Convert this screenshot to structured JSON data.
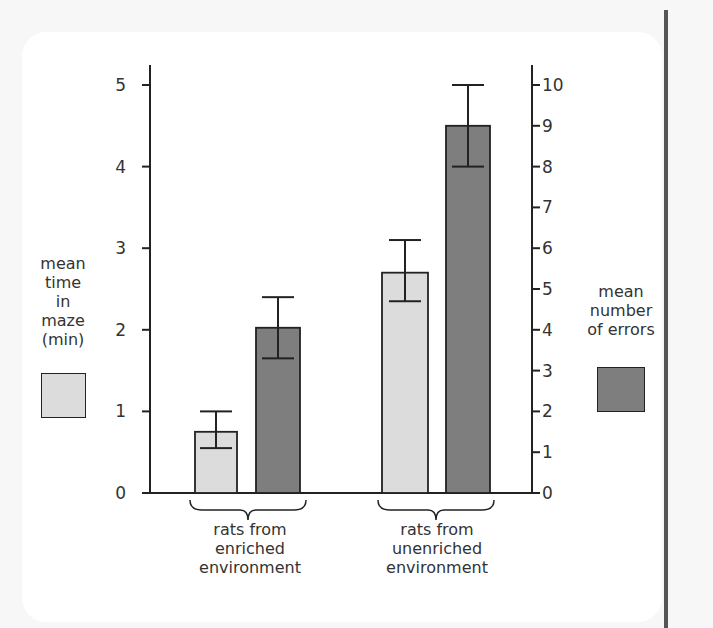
{
  "chart_data": {
    "type": "bar",
    "title": "",
    "categories": [
      "rats from enriched environment",
      "rats from unenriched environment"
    ],
    "series": [
      {
        "name": "mean time in maze (min)",
        "axis": "left",
        "color": "#dcdcdc",
        "values": [
          0.75,
          2.7
        ],
        "error_low": [
          0.55,
          2.35
        ],
        "error_high": [
          1.0,
          3.1
        ]
      },
      {
        "name": "mean number of errors",
        "axis": "right",
        "color": "#7e7e7e",
        "values": [
          4.05,
          9.0
        ],
        "error_low": [
          3.3,
          8.0
        ],
        "error_high": [
          4.8,
          10.0
        ]
      }
    ],
    "left_axis": {
      "label": "mean time in maze (min)",
      "ylim": [
        0,
        5
      ],
      "ticks": [
        "0",
        "1",
        "2",
        "3",
        "4",
        "5"
      ]
    },
    "right_axis": {
      "label": "mean number of errors",
      "ylim": [
        0,
        10
      ],
      "ticks": [
        "0",
        "1",
        "2",
        "3",
        "4",
        "5",
        "6",
        "7",
        "8",
        "9",
        "10"
      ]
    },
    "grid": false,
    "legend_position": "sides"
  },
  "labels": {
    "left_axis": [
      "mean",
      "time",
      "in",
      "maze",
      "(min)"
    ],
    "right_axis": [
      "mean",
      "number",
      "of errors"
    ],
    "group1": [
      "rats from",
      "enriched",
      "environment"
    ],
    "group2": [
      "rats from",
      "unenriched",
      "environment"
    ]
  },
  "colors": {
    "light_bar": "#dcdcdc",
    "dark_bar": "#7e7e7e",
    "axis": "#222222"
  }
}
